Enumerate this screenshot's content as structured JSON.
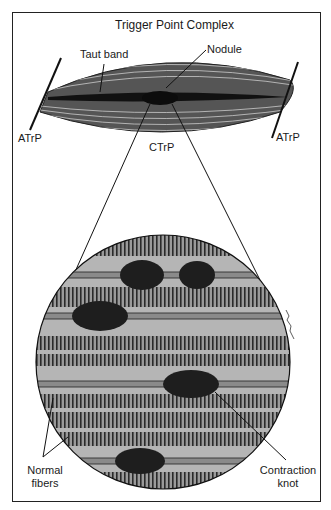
{
  "title": "Trigger Point Complex",
  "labels": {
    "taut_band": "Taut band",
    "nodule": "Nodule",
    "atrp_left": "ATrP",
    "atrp_right": "ATrP",
    "ctrp": "CTrP",
    "normal_fibers_line1": "Normal",
    "normal_fibers_line2": "fibers",
    "contraction_knot_line1": "Contraction",
    "contraction_knot_line2": "knot"
  },
  "colors": {
    "ink": "#1a1a1a",
    "fiber_dark": "#3a3a3a",
    "fiber_mid": "#8a8a8a",
    "fiber_light": "#b8b8b8",
    "knot": "#1e1e1e"
  }
}
